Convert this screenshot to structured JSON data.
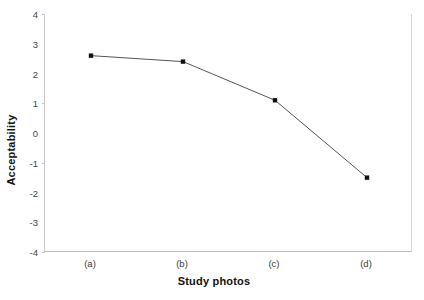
{
  "chart_data": {
    "type": "line",
    "title": "",
    "xlabel": "Study photos",
    "ylabel": "Acceptability",
    "categories": [
      "(a)",
      "(b)",
      "(c)",
      "(d)"
    ],
    "values": [
      2.6,
      2.4,
      1.1,
      -1.5
    ],
    "series": [
      {
        "name": "Acceptability",
        "values": [
          2.6,
          2.4,
          1.1,
          -1.5
        ]
      }
    ],
    "ylim": [
      -4,
      4
    ],
    "y_ticks": [
      4,
      3,
      2,
      1,
      0,
      -1,
      -2,
      -3,
      -4
    ],
    "y_tick_labels": [
      "4",
      "3",
      "2",
      "1",
      "0",
      "-1",
      "-2",
      "-3",
      "-4"
    ],
    "x_tick_labels": [
      "(a)",
      "(b)",
      "(c)",
      "(d)"
    ],
    "grid": false,
    "legend": false,
    "legend_position": "none",
    "marker": "filled-square",
    "line_color": "#555555",
    "marker_color": "#111111",
    "axis_color": "#c0c0c0",
    "background_color": "#ffffff",
    "text_color": "#111111"
  }
}
